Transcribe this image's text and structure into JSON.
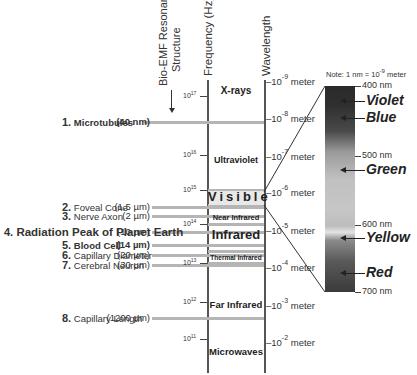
{
  "headers": {
    "bio_emf": [
      "Bio-EMF Resonant",
      "Structure"
    ],
    "frequency": "Frequency (Hz)",
    "wavelength": "Wavelength"
  },
  "note": {
    "prefix": "Note: 1 nm = 10",
    "exp": "-9",
    "suffix": " meter"
  },
  "frequency_ticks": [
    {
      "base": "10",
      "exp": "17",
      "y": 96
    },
    {
      "base": "10",
      "exp": "16",
      "y": 155
    },
    {
      "base": "10",
      "exp": "15",
      "y": 190
    },
    {
      "base": "10",
      "exp": "14",
      "y": 224
    },
    {
      "base": "10",
      "exp": "13",
      "y": 263
    },
    {
      "base": "10",
      "exp": "12",
      "y": 302
    },
    {
      "base": "10",
      "exp": "11",
      "y": 339
    }
  ],
  "wavelength_ticks": [
    {
      "base": "–10",
      "exp": "-9",
      "unit": " meter",
      "y": 81
    },
    {
      "base": "–10",
      "exp": "-8",
      "unit": " meter",
      "y": 118
    },
    {
      "base": "–10",
      "exp": "-7",
      "unit": " meter",
      "y": 156
    },
    {
      "base": "–10",
      "exp": "-6",
      "unit": " meter",
      "y": 192
    },
    {
      "base": "–10",
      "exp": "-5",
      "unit": " meter",
      "y": 230
    },
    {
      "base": "–10",
      "exp": "-4",
      "unit": " meter",
      "y": 267
    },
    {
      "base": "–10",
      "exp": "-3",
      "unit": " meter",
      "y": 305
    },
    {
      "base": "–10",
      "exp": "-2",
      "unit": " meter",
      "y": 342
    }
  ],
  "regions": [
    {
      "label": "X-rays",
      "y": 91,
      "size": 10
    },
    {
      "label": "Ultraviolet",
      "y": 160,
      "size": 9
    },
    {
      "label": "Visible",
      "y": 197,
      "size": 13
    },
    {
      "label": "Near Infrared",
      "y": 217,
      "size": 7.5
    },
    {
      "label": "Infrared",
      "y": 235,
      "size": 13
    },
    {
      "label": "Thermal Infrared",
      "y": 258,
      "size": 6.5
    },
    {
      "label": "Far Infrared",
      "y": 305,
      "size": 9.5
    },
    {
      "label": "Microwaves",
      "y": 352,
      "size": 9.5
    }
  ],
  "structures": [
    {
      "num": "1.",
      "name": "Microtubules",
      "size": "(40 nm)",
      "bold": true,
      "y": 123
    },
    {
      "num": "2.",
      "name": "Foveal Cone",
      "size": "(1.5 µm)",
      "bold": false,
      "y": 208
    },
    {
      "num": "3.",
      "name": "Nerve Axon",
      "size": "(2 µm)",
      "bold": false,
      "y": 217
    },
    {
      "num": "4.",
      "name": "Radiation Peak of Planet Earth",
      "size": "(10 µm)",
      "bold": true,
      "y": 233
    },
    {
      "num": "5.",
      "name": "Blood Cell",
      "size": "(14 µm)",
      "bold": true,
      "y": 246
    },
    {
      "num": "6.",
      "name": "Capillary Diameter",
      "size": "(20 µm)",
      "bold": false,
      "y": 256
    },
    {
      "num": "7.",
      "name": "Cerebral Neuron",
      "size": "(30 µm)",
      "bold": false,
      "y": 266
    },
    {
      "num": "8.",
      "name": "Capillary Length",
      "size": "(1200 µm)",
      "bold": false,
      "y": 319
    }
  ],
  "visible_spectrum": {
    "scale": [
      {
        "label": "400 nm",
        "y": 86
      },
      {
        "label": "500 nm",
        "y": 156
      },
      {
        "label": "600 nm",
        "y": 225
      },
      {
        "label": "700 nm",
        "y": 292
      }
    ],
    "colors": [
      {
        "label": "Violet",
        "y": 101
      },
      {
        "label": "Blue",
        "y": 118
      },
      {
        "label": "Green",
        "y": 170
      },
      {
        "label": "Yellow",
        "y": 238
      },
      {
        "label": "Red",
        "y": 273
      }
    ]
  },
  "chart_data": {
    "type": "table",
    "regions": [
      "X-rays",
      "Ultraviolet",
      "Visible",
      "Near Infrared",
      "Infrared",
      "Thermal Infrared",
      "Far Infrared",
      "Microwaves"
    ],
    "frequency_ticks_hz": [
      "10^17",
      "10^16",
      "10^15",
      "10^14",
      "10^13",
      "10^12",
      "10^11"
    ],
    "wavelength_ticks_m": [
      "10^-9",
      "10^-8",
      "10^-7",
      "10^-6",
      "10^-5",
      "10^-4",
      "10^-3",
      "10^-2"
    ],
    "structures": [
      {
        "name": "Microtubules",
        "wavelength": "40 nm"
      },
      {
        "name": "Foveal Cone",
        "wavelength": "1.5 µm"
      },
      {
        "name": "Nerve Axon",
        "wavelength": "2 µm"
      },
      {
        "name": "Radiation Peak of Planet Earth",
        "wavelength": "10 µm"
      },
      {
        "name": "Blood Cell",
        "wavelength": "14 µm"
      },
      {
        "name": "Capillary Diameter",
        "wavelength": "20 µm"
      },
      {
        "name": "Cerebral Neuron",
        "wavelength": "30 µm"
      },
      {
        "name": "Capillary Length",
        "wavelength": "1200 µm"
      }
    ],
    "visible_nm": [
      400,
      500,
      600,
      700
    ],
    "visible_colors": [
      "Violet",
      "Blue",
      "Green",
      "Yellow",
      "Red"
    ]
  }
}
